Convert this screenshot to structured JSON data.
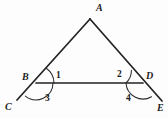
{
  "figure": {
    "background_color": "#fdfdfd",
    "line_color": "#222222",
    "label_color": "#1c1c1c"
  },
  "vertices": {
    "a": {
      "label": "A",
      "x": 90,
      "y": 19,
      "label_x": 96,
      "label_y": 11
    },
    "b": {
      "label": "B",
      "x": 36,
      "y": 83,
      "label_x": 22,
      "label_y": 80
    },
    "c": {
      "label": "C",
      "x": 17,
      "y": 100,
      "label_x": 5,
      "label_y": 110
    },
    "d": {
      "label": "D",
      "x": 143,
      "y": 83,
      "label_x": 146,
      "label_y": 79
    },
    "e": {
      "label": "E",
      "x": 162,
      "y": 101,
      "label_x": 157,
      "label_y": 111
    }
  },
  "angles": [
    {
      "id": "angle-1",
      "label": "1",
      "x": 56,
      "y": 78,
      "at_vertex": "B",
      "position": "interior-upper-right"
    },
    {
      "id": "angle-2",
      "label": "2",
      "x": 117,
      "y": 77,
      "at_vertex": "D",
      "position": "interior-upper-left"
    },
    {
      "id": "angle-3",
      "label": "3",
      "x": 45,
      "y": 101,
      "at_vertex": "B",
      "position": "exterior-lower-right"
    },
    {
      "id": "angle-4",
      "label": "4",
      "x": 126,
      "y": 101,
      "at_vertex": "D",
      "position": "exterior-lower-left"
    }
  ],
  "segments": [
    {
      "id": "segment-ca",
      "from": "C",
      "to": "A",
      "description": "line through C, B up to apex A"
    },
    {
      "id": "segment-ae",
      "from": "A",
      "to": "E",
      "description": "line from apex A through D down to E"
    },
    {
      "id": "segment-bd",
      "from": "B",
      "to": "D",
      "description": "horizontal base segment from B to D"
    }
  ]
}
